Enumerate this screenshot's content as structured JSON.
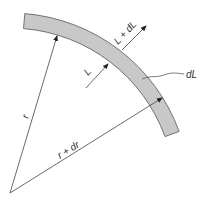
{
  "diagram": {
    "title": "",
    "labels": {
      "r": "r",
      "r_plus_dr": "r + dr",
      "L": "L",
      "L_plus_dL": "L + dL",
      "dL": "dL"
    },
    "colors": {
      "band_fill": "#c8c8c8",
      "band_stroke": "#555555",
      "line": "#444444",
      "text": "#333333",
      "background": "#ffffff"
    },
    "geometry": {
      "origin": [
        10,
        193
      ],
      "inner_radius": 165,
      "outer_radius": 180,
      "arc_start_deg": -85.3,
      "arc_end_deg": -20
    }
  }
}
